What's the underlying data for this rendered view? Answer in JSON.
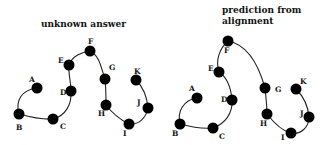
{
  "panels": [
    {
      "title": [
        "unknown answer"
      ],
      "title_pos": [
        [
          41,
          27
        ]
      ],
      "nodes": [
        {
          "id": "A",
          "x": 37,
          "y": 88,
          "lx": 29,
          "ly": 82
        },
        {
          "id": "B",
          "x": 19,
          "y": 114,
          "lx": 16,
          "ly": 130
        },
        {
          "id": "C",
          "x": 53,
          "y": 119,
          "lx": 60,
          "ly": 129
        },
        {
          "id": "D",
          "x": 71,
          "y": 91,
          "lx": 60,
          "ly": 95
        },
        {
          "id": "E",
          "x": 69,
          "y": 65,
          "lx": 58,
          "ly": 63
        },
        {
          "id": "F",
          "x": 90,
          "y": 51,
          "lx": 88,
          "ly": 44
        },
        {
          "id": "G",
          "x": 105,
          "y": 79,
          "lx": 109,
          "ly": 70
        },
        {
          "id": "H",
          "x": 106,
          "y": 105,
          "lx": 98,
          "ly": 116
        },
        {
          "id": "I",
          "x": 129,
          "y": 124,
          "lx": 123,
          "ly": 136
        },
        {
          "id": "J",
          "x": 148,
          "y": 108,
          "lx": 137,
          "ly": 105
        },
        {
          "id": "K",
          "x": 136,
          "y": 80,
          "lx": 134,
          "ly": 74
        }
      ],
      "path": "M37,88 C22,90 15,100 19,114 C30,117 42,120 53,119 C65,116 72,105 71,91 C71,82 68,73 69,65 C72,56 82,52 90,51 C100,56 101,68 105,79 C106,88 106,97 106,105 C112,113 121,120 129,124 C139,125 146,118 148,108 C147,96 142,86 136,80"
    },
    {
      "title": [
        "prediction from",
        "alignment"
      ],
      "title_pos": [
        [
          222,
          13
        ],
        [
          222,
          24
        ]
      ],
      "nodes": [
        {
          "id": "A",
          "x": 197,
          "y": 98,
          "lx": 189,
          "ly": 91
        },
        {
          "id": "B",
          "x": 180,
          "y": 124,
          "lx": 172,
          "ly": 136
        },
        {
          "id": "C",
          "x": 213,
          "y": 128,
          "lx": 219,
          "ly": 139
        },
        {
          "id": "D",
          "x": 232,
          "y": 100,
          "lx": 221,
          "ly": 102
        },
        {
          "id": "E",
          "x": 219,
          "y": 72,
          "lx": 208,
          "ly": 71
        },
        {
          "id": "F",
          "x": 228,
          "y": 41,
          "lx": 224,
          "ly": 53
        },
        {
          "id": "G",
          "x": 265,
          "y": 88,
          "lx": 275,
          "ly": 92
        },
        {
          "id": "H",
          "x": 267,
          "y": 114,
          "lx": 260,
          "ly": 126
        },
        {
          "id": "I",
          "x": 291,
          "y": 133,
          "lx": 281,
          "ly": 140
        },
        {
          "id": "J",
          "x": 309,
          "y": 117,
          "lx": 300,
          "ly": 116
        },
        {
          "id": "K",
          "x": 296,
          "y": 89,
          "lx": 300,
          "ly": 84
        }
      ],
      "path": "M197,98 C183,100 177,112 180,124 C191,127 202,129 213,128 C225,124 233,113 232,100 C231,88 228,78 219,72 C215,60 220,48 228,41 C250,45 260,70 265,88 C266,97 267,106 267,114 C274,123 282,131 291,133 C301,135 309,127 309,117 C308,104 302,95 296,89"
    }
  ],
  "style": {
    "node_color": "#000000",
    "curve_color": "#222222",
    "background": "#ffffff",
    "node_radius": 5.5
  }
}
